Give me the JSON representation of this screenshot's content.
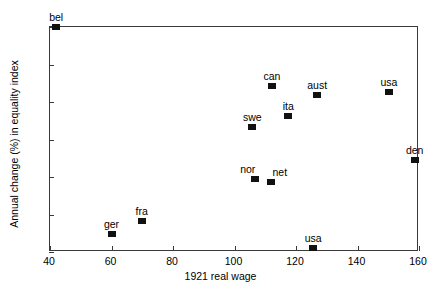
{
  "chart_data": {
    "type": "scatter",
    "title": "",
    "xlabel": "1921 real wage",
    "ylabel": "Annual change (%) in equality index",
    "xlim": [
      40,
      160
    ],
    "ylim": [
      -4,
      2
    ],
    "xticks": [
      40,
      60,
      80,
      100,
      120,
      140,
      160
    ],
    "yticks": [
      2,
      1,
      0,
      -1,
      -2,
      -3,
      -4
    ],
    "xtick_labels": [
      "40",
      "60",
      "80",
      "100",
      "120",
      "140",
      "160"
    ],
    "ytick_labels": [
      "2",
      "1",
      "0",
      "−1",
      "−2",
      "−3",
      "−4"
    ],
    "grid": false,
    "legend": "none",
    "marker": "filled-square",
    "marker_color": "#111111",
    "points": [
      {
        "label": "bel",
        "x": 42.0,
        "y": 2.0,
        "label_pos": "above"
      },
      {
        "label": "ger",
        "x": 60.0,
        "y": -3.52,
        "label_pos": "above"
      },
      {
        "label": "fra",
        "x": 69.8,
        "y": -3.18,
        "label_pos": "above"
      },
      {
        "label": "swe",
        "x": 105.8,
        "y": -0.66,
        "label_pos": "above"
      },
      {
        "label": "nor",
        "x": 106.6,
        "y": -2.05,
        "label_pos": "above-left"
      },
      {
        "label": "net",
        "x": 111.8,
        "y": -2.12,
        "label_pos": "above-right"
      },
      {
        "label": "can",
        "x": 112.2,
        "y": 0.44,
        "label_pos": "above"
      },
      {
        "label": "ita",
        "x": 117.5,
        "y": -0.36,
        "label_pos": "above"
      },
      {
        "label": "usa",
        "x": 125.6,
        "y": -3.9,
        "label_pos": "above"
      },
      {
        "label": "aust",
        "x": 126.9,
        "y": 0.18,
        "label_pos": "above"
      },
      {
        "label": "usa",
        "x": 150.2,
        "y": 0.27,
        "label_pos": "above"
      },
      {
        "label": "den",
        "x": 158.6,
        "y": -1.55,
        "label_pos": "above"
      }
    ]
  }
}
